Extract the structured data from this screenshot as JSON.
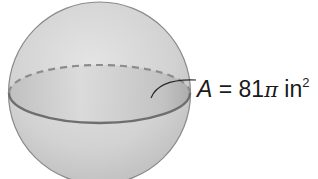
{
  "figure": {
    "type": "sphere-with-great-circle",
    "label": {
      "variable": "A",
      "equals": "=",
      "coefficient": "81",
      "symbol": "π",
      "unit": "in",
      "exponent": "2"
    },
    "colors": {
      "sphere_fill": "#d6d6d6",
      "sphere_outline": "#8a8a8a",
      "cross_section_fill": "#c4c4c4",
      "equator_line": "#6e6e6e",
      "text": "#1a1a1a"
    }
  }
}
